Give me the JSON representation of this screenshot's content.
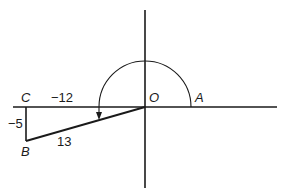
{
  "diagram": {
    "colors": {
      "stroke": "#1a1a1a",
      "background": "#ffffff"
    },
    "axes": {
      "horizontal": {
        "x1": 13,
        "y1": 107,
        "x2": 277,
        "y2": 107
      },
      "vertical": {
        "x1": 145,
        "y1": 10,
        "x2": 145,
        "y2": 188
      }
    },
    "points": {
      "O": {
        "label": "O",
        "x": 145,
        "y": 107
      },
      "A": {
        "label": "A",
        "x": 191,
        "y": 107
      },
      "B": {
        "label": "B",
        "x": 26,
        "y": 141
      },
      "C": {
        "label": "C",
        "x": 26,
        "y": 107
      }
    },
    "labels": {
      "C": "C",
      "O": "O",
      "A": "A",
      "B": "B",
      "side_CO": "−12",
      "side_CB": "−5",
      "side_OB": "13"
    },
    "arc": {
      "description": "Counterclockwise rotation arc from OA to OB",
      "radius": 46,
      "center": "O"
    }
  }
}
